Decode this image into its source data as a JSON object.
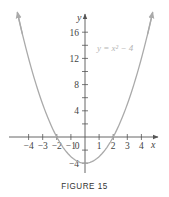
{
  "caption": "FIGURE 15",
  "chart_data": {
    "type": "line",
    "title": "",
    "equation_label": "y = x² − 4",
    "xlabel": "x",
    "ylabel": "y",
    "xlim": [
      -5.5,
      5.2
    ],
    "ylim": [
      -5.4,
      18.5
    ],
    "x_ticks": [
      -4,
      -3,
      -2,
      -1,
      1,
      2,
      3,
      4
    ],
    "x_tick_labels": [
      "−4",
      "−3",
      "−2",
      "−1",
      "1",
      "2",
      "3",
      "4"
    ],
    "y_ticks": [
      -4,
      -2,
      2,
      4,
      6,
      8,
      10,
      12,
      14,
      16
    ],
    "y_tick_labels_shown": [
      {
        "value": 16,
        "label": "16"
      },
      {
        "value": 12,
        "label": "12"
      },
      {
        "value": 8,
        "label": "8"
      },
      {
        "value": 4,
        "label": "4"
      },
      {
        "value": -4,
        "label": "−4"
      }
    ],
    "origin_label": "0",
    "grid": false,
    "legend": null,
    "series": [
      {
        "name": "y = x² − 4",
        "color": "#aaaaaa",
        "x": [
          -4.8,
          -4,
          -3,
          -2,
          -1,
          0,
          1,
          2,
          3,
          4,
          4.8
        ],
        "y": [
          19.04,
          12,
          5,
          0,
          -3,
          -4,
          -3,
          0,
          5,
          12,
          19.04
        ],
        "arrows_at_ends": true
      }
    ]
  },
  "colors": {
    "axis": "#555555",
    "curve": "#aaaaaa",
    "label": "#444444",
    "equation": "#b5b5b5"
  }
}
